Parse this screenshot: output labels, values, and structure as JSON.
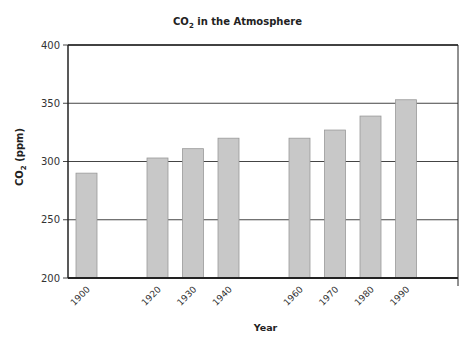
{
  "chart_data": {
    "type": "bar",
    "title": "CO2 in the Atmosphere",
    "title_main": "CO",
    "title_sub": "2",
    "title_rest": " in the Atmosphere",
    "xlabel": "Year",
    "ylabel": "CO2 (ppm)",
    "ylabel_main": "CO",
    "ylabel_sub": "2",
    "ylabel_rest": " (ppm)",
    "categories": [
      "1900",
      "1920",
      "1930",
      "1940",
      "1960",
      "1970",
      "1980",
      "1990"
    ],
    "values": [
      290,
      303,
      311,
      320,
      320,
      327,
      339,
      353
    ],
    "ylim": [
      200,
      400
    ],
    "yticks": [
      200,
      250,
      300,
      350,
      400
    ],
    "grid": true,
    "legend": null,
    "bar_color": "#c8c8c8"
  }
}
